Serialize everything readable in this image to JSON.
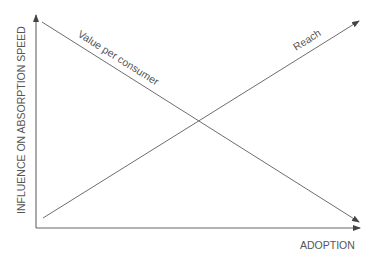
{
  "diagram": {
    "x_axis_label": "ADOPTION",
    "y_axis_label": "INFLUENCE ON ABSORPTION SPEED",
    "lines": [
      {
        "name": "Value per consumer",
        "direction": "decreasing"
      },
      {
        "name": "Reach",
        "direction": "increasing"
      }
    ],
    "colors": {
      "axis": "#555555",
      "line": "#6e6e6e",
      "text": "#555555"
    }
  }
}
